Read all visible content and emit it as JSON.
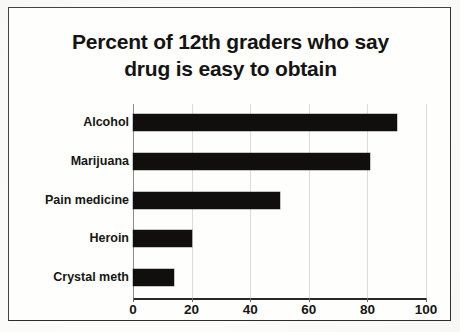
{
  "chart_data": {
    "type": "bar",
    "orientation": "horizontal",
    "title": "Percent of 12th graders who say drug is easy to obtain",
    "title_lines": [
      "Percent of 12th graders who say",
      "drug is easy to obtain"
    ],
    "categories": [
      "Alcohol",
      "Marijuana",
      "Pain medicine",
      "Heroin",
      "Crystal meth"
    ],
    "values": [
      90,
      81,
      50,
      20,
      14
    ],
    "xlabel": "",
    "ylabel": "",
    "xlim": [
      0,
      100
    ],
    "xticks": [
      0,
      20,
      40,
      60,
      80,
      100
    ],
    "xtick_labels": [
      "0",
      "20",
      "40",
      "60",
      "80",
      "100"
    ],
    "grid": "vertical",
    "legend": "none",
    "bar_color": "#100f0e"
  },
  "colors": {
    "page_background": "#fcfcfa",
    "border": "#45423f",
    "bar": "#100f0e",
    "text": "#171615",
    "gridline": "#dedad4",
    "axis": "#2a2826"
  }
}
